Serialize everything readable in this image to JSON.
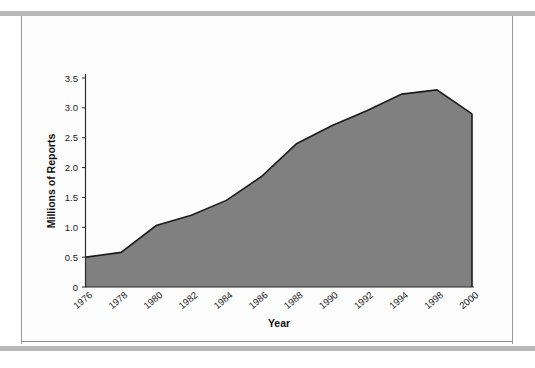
{
  "page": {
    "background_color": "#ffffff",
    "rule_color": "#b9b9b9",
    "frame_border_color": "#9a9a9a"
  },
  "chart_data": {
    "type": "area",
    "title": "",
    "subtitle": "",
    "xlabel": "Year",
    "ylabel": "Millions of Reports",
    "grid": false,
    "legend": "none",
    "fill_color": "#808080",
    "line_color": "#1c1c1c",
    "xlim": [
      1976,
      2000
    ],
    "ylim": [
      0,
      3.5
    ],
    "ytick_labels": [
      "3.5",
      "3.0",
      "2.5",
      "2.0",
      "1.5",
      "1.0",
      "0.5",
      "0"
    ],
    "ytick_values": [
      3.5,
      3.0,
      2.5,
      2.0,
      1.5,
      1.0,
      0.5,
      0
    ],
    "xtick_labels": [
      "1976",
      "1978",
      "1980",
      "1982",
      "1984",
      "1986",
      "1988",
      "1990",
      "1992",
      "1994",
      "1998",
      "2000"
    ],
    "x": [
      1976,
      1978,
      1980,
      1982,
      1984,
      1986,
      1988,
      1990,
      1992,
      1994,
      1998,
      2000
    ],
    "values": [
      0.5,
      0.58,
      1.03,
      1.2,
      1.45,
      1.85,
      2.4,
      2.7,
      2.95,
      3.23,
      3.3,
      2.9
    ],
    "series": [
      {
        "name": "Millions of Reports",
        "values": [
          0.5,
          0.58,
          1.03,
          1.2,
          1.45,
          1.85,
          2.4,
          2.7,
          2.95,
          3.23,
          3.3,
          2.9
        ]
      }
    ]
  }
}
